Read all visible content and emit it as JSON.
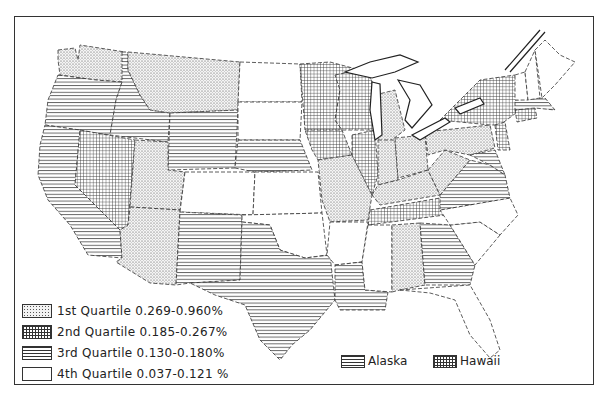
{
  "map": {
    "title": "",
    "region": "Contiguous United States",
    "legend": [
      {
        "label": "1st Quartile 0.269-0.960%",
        "pattern": "dots"
      },
      {
        "label": "2nd Quartile 0.185-0.267%",
        "pattern": "grid"
      },
      {
        "label": "3rd Quartile 0.130-0.180%",
        "pattern": "horizontal-lines"
      },
      {
        "label": "4th Quartile 0.037-0.121 %",
        "pattern": "blank"
      }
    ],
    "insets": [
      {
        "label": "Alaska",
        "pattern": "horizontal-lines"
      },
      {
        "label": "Hawaii",
        "pattern": "grid"
      }
    ],
    "states": {
      "1st": [
        "Washington",
        "Montana",
        "Utah",
        "Arizona",
        "Missouri",
        "Michigan",
        "Indiana",
        "Ohio",
        "Kentucky",
        "West Virginia",
        "Pennsylvania",
        "Alabama"
      ],
      "2nd": [
        "Nevada",
        "Minnesota",
        "Wisconsin",
        "Iowa",
        "Illinois",
        "Tennessee",
        "New York",
        "New Jersey",
        "Connecticut",
        "Delaware"
      ],
      "3rd": [
        "Oregon",
        "Idaho",
        "California",
        "Wyoming",
        "Nebraska",
        "New Mexico",
        "Texas",
        "Louisiana",
        "Virginia",
        "Georgia",
        "Massachusetts",
        "Maryland"
      ],
      "4th": [
        "North Dakota",
        "South Dakota",
        "Colorado",
        "Kansas",
        "Oklahoma",
        "Arkansas",
        "Mississippi",
        "North Carolina",
        "South Carolina",
        "Florida",
        "Maine",
        "New Hampshire",
        "Vermont"
      ]
    }
  }
}
